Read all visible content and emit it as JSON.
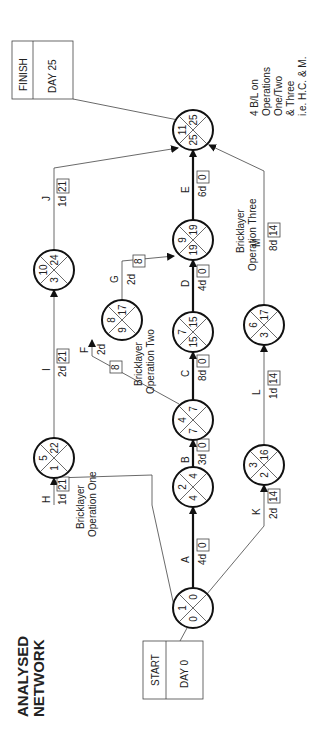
{
  "title": [
    "ANALYSED",
    "NETWORK"
  ],
  "start": {
    "label": "START",
    "day": "DAY 0"
  },
  "finish": {
    "label": "FINISH",
    "day": "DAY 25"
  },
  "notes": {
    "op_one": [
      "Bricklayer",
      "Operation One"
    ],
    "op_two": [
      "Bricklayer",
      "Operation Two"
    ],
    "op_three": [
      "Bricklayer",
      "Operation Three"
    ],
    "finish_note": [
      "4 B/L on",
      "Operations",
      "One/Two",
      "& Three",
      "i.e. H.C. & M."
    ]
  },
  "nodes": [
    {
      "id": "1",
      "top": "1",
      "left": "0",
      "right": "0",
      "bottom": "0"
    },
    {
      "id": "2",
      "top": "2",
      "left": "4",
      "right": "4",
      "bottom": "4"
    },
    {
      "id": "4",
      "top": "4",
      "left": "7",
      "right": "7",
      "bottom": "7"
    },
    {
      "id": "7",
      "top": "7",
      "left": "15",
      "right": "15",
      "bottom": "15"
    },
    {
      "id": "9",
      "top": "9",
      "left": "19",
      "right": "19",
      "bottom": "19"
    },
    {
      "id": "11",
      "top": "11",
      "left": "25",
      "right": "25",
      "bottom": "25"
    },
    {
      "id": "8",
      "top": "8",
      "left": "9",
      "right": "17",
      "bottom": "9"
    },
    {
      "id": "5",
      "top": "5",
      "left": "1",
      "right": "22",
      "bottom": "1"
    },
    {
      "id": "10",
      "top": "10",
      "left": "3",
      "right": "24",
      "bottom": "3"
    },
    {
      "id": "3",
      "top": "3",
      "left": "2",
      "right": "16",
      "bottom": "2"
    },
    {
      "id": "6",
      "top": "6",
      "left": "3",
      "right": "17",
      "bottom": "3"
    }
  ],
  "activities": [
    {
      "name": "A",
      "duration": "4d",
      "float": "0",
      "critical": true
    },
    {
      "name": "B",
      "duration": "3d",
      "float": "0",
      "critical": true
    },
    {
      "name": "C",
      "duration": "8d",
      "float": "0",
      "critical": true
    },
    {
      "name": "D",
      "duration": "4d",
      "float": "0",
      "critical": true
    },
    {
      "name": "E",
      "duration": "6d",
      "float": "0",
      "critical": true
    },
    {
      "name": "F",
      "duration": "2d",
      "float": "8",
      "critical": false
    },
    {
      "name": "G",
      "duration": "2d",
      "float": "8",
      "critical": false
    },
    {
      "name": "H",
      "duration": "1d",
      "float": "21",
      "critical": false
    },
    {
      "name": "I",
      "duration": "2d",
      "float": "21",
      "critical": false
    },
    {
      "name": "J",
      "duration": "1d",
      "float": "21",
      "critical": false
    },
    {
      "name": "K",
      "duration": "2d",
      "float": "14",
      "critical": false
    },
    {
      "name": "L",
      "duration": "1d",
      "float": "14",
      "critical": false
    },
    {
      "name": "M",
      "duration": "8d",
      "float": "14",
      "critical": false
    }
  ]
}
